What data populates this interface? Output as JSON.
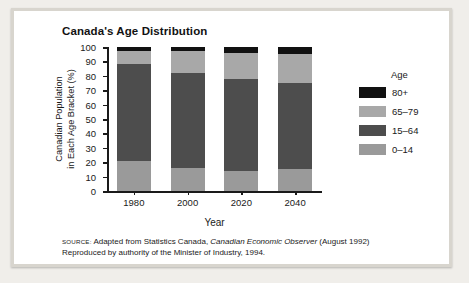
{
  "chart_data": {
    "type": "bar",
    "subtype": "stacked-percentage",
    "title": "Canada's Age Distribution",
    "xlabel": "Year",
    "ylabel_line1": "Canadian Population",
    "ylabel_line2": "in Each Age Bracket (%)",
    "categories": [
      "1980",
      "2000",
      "2020",
      "2040"
    ],
    "ylim": [
      0,
      100
    ],
    "yticks": [
      "0",
      "10",
      "20",
      "30",
      "40",
      "50",
      "60",
      "70",
      "80",
      "90",
      "100"
    ],
    "grid": false,
    "legend_position": "right",
    "legend_title": "Age",
    "stack_order_bottom_to_top": [
      "0–14",
      "15–64",
      "65–79",
      "80+"
    ],
    "series": [
      {
        "name": "0–14",
        "color": "#9a9a9a",
        "values": [
          21,
          16,
          14,
          15
        ]
      },
      {
        "name": "15–64",
        "color": "#4d4d4d",
        "values": [
          67,
          66,
          64,
          60
        ]
      },
      {
        "name": "65–79",
        "color": "#a8a8a8",
        "values": [
          9,
          15,
          18,
          20
        ]
      },
      {
        "name": "80+",
        "color": "#111111",
        "values": [
          3,
          3,
          4,
          5
        ]
      }
    ]
  },
  "legend": {
    "title": "Age",
    "items": [
      {
        "label": "80+",
        "color": "#111111"
      },
      {
        "label": "65–79",
        "color": "#a8a8a8"
      },
      {
        "label": "15–64",
        "color": "#4d4d4d"
      },
      {
        "label": "0–14",
        "color": "#9a9a9a"
      }
    ]
  },
  "source": {
    "tag": "Source:",
    "line1_rest_a": " Adapted from Statistics Canada, ",
    "line1_italic": "Canadian Economic Observer",
    "line1_rest_b": " (August 1992)",
    "line2": "Reproduced by authority of the Minister of Industry, 1994."
  }
}
